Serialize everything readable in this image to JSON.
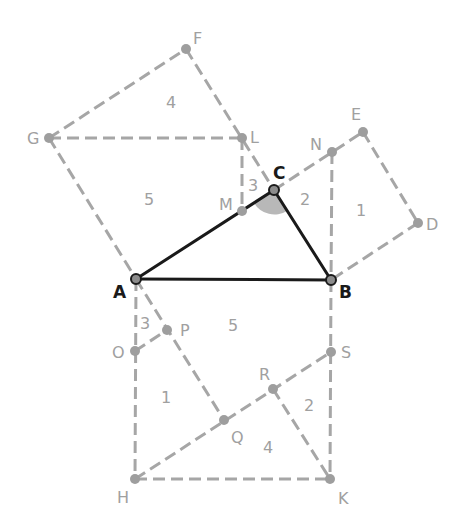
{
  "diagram": {
    "colors": {
      "construction_line": "#a6a6a6",
      "triangle_line": "#1a1a1a",
      "point": "#9e9e9e",
      "label": "#a0a0a0",
      "main_label": "#1a1a1a",
      "angle_fill": "#b8b8b8"
    },
    "points": {
      "A": {
        "label": "A",
        "x": 136,
        "y": 279
      },
      "B": {
        "label": "B",
        "x": 331,
        "y": 280
      },
      "C": {
        "label": "C",
        "x": 274,
        "y": 190
      },
      "D": {
        "label": "D",
        "x": 418,
        "y": 223
      },
      "E": {
        "label": "E",
        "x": 363,
        "y": 132
      },
      "F": {
        "label": "F",
        "x": 186,
        "y": 49
      },
      "G": {
        "label": "G",
        "x": 49,
        "y": 138
      },
      "H": {
        "label": "H",
        "x": 135,
        "y": 479
      },
      "K": {
        "label": "K",
        "x": 330,
        "y": 479
      },
      "L": {
        "label": "L",
        "x": 242,
        "y": 138
      },
      "M": {
        "label": "M",
        "x": 242,
        "y": 211
      },
      "N": {
        "label": "N",
        "x": 332,
        "y": 152
      },
      "O": {
        "label": "O",
        "x": 135,
        "y": 351
      },
      "P": {
        "label": "P",
        "x": 167,
        "y": 330
      },
      "Q": {
        "label": "Q",
        "x": 224,
        "y": 420
      },
      "R": {
        "label": "R",
        "x": 273,
        "y": 389
      },
      "S": {
        "label": "S",
        "x": 331,
        "y": 352
      }
    },
    "region_numbers": [
      {
        "text": "4",
        "x": 172,
        "y": 108
      },
      {
        "text": "5",
        "x": 150,
        "y": 204
      },
      {
        "text": "3",
        "x": 252,
        "y": 189
      },
      {
        "text": "2",
        "x": 305,
        "y": 205
      },
      {
        "text": "1",
        "x": 362,
        "y": 215
      },
      {
        "text": "3",
        "x": 146,
        "y": 328
      },
      {
        "text": "5",
        "x": 234,
        "y": 330
      },
      {
        "text": "1",
        "x": 166,
        "y": 403
      },
      {
        "text": "2",
        "x": 309,
        "y": 410
      },
      {
        "text": "4",
        "x": 269,
        "y": 452
      }
    ],
    "right_angle_marker": {
      "vertex": "C",
      "shaded": true
    }
  }
}
